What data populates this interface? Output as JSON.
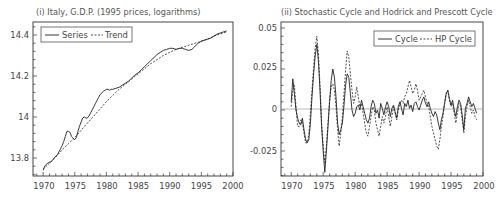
{
  "chart_data": [
    {
      "type": "line",
      "title": "(i) Italy, G.D.P. (1995 prices, logarithms)",
      "xlabel": "",
      "ylabel": "",
      "xlim": [
        1968,
        2000
      ],
      "ylim": [
        13.72,
        14.45
      ],
      "xticks": [
        1970,
        1975,
        1980,
        1985,
        1990,
        1995,
        2000
      ],
      "yticks": [
        13.8,
        14,
        14.2,
        14.4
      ],
      "ytick_labels": [
        "13.8",
        "14",
        "14.2",
        "14.4"
      ],
      "grid": false,
      "legend_position": "upper left",
      "series": [
        {
          "name": "Series",
          "style": "solid",
          "x": [
            1970.0,
            1970.25,
            1970.5,
            1970.75,
            1971.0,
            1971.25,
            1971.5,
            1971.75,
            1972.0,
            1972.25,
            1972.5,
            1972.75,
            1973.0,
            1973.25,
            1973.5,
            1973.75,
            1974.0,
            1974.25,
            1974.5,
            1974.75,
            1975.0,
            1975.25,
            1975.5,
            1975.75,
            1976.0,
            1976.25,
            1976.5,
            1976.75,
            1977.0,
            1977.25,
            1977.5,
            1977.75,
            1978.0,
            1978.25,
            1978.5,
            1978.75,
            1979.0,
            1979.5,
            1980.0,
            1980.25,
            1980.5,
            1980.75,
            1981.0,
            1981.5,
            1982.0,
            1982.5,
            1983.0,
            1983.5,
            1984.0,
            1984.5,
            1985.0,
            1985.5,
            1986.0,
            1986.5,
            1987.0,
            1987.5,
            1988.0,
            1988.5,
            1989.0,
            1989.5,
            1990.0,
            1990.5,
            1991.0,
            1991.5,
            1992.0,
            1992.5,
            1993.0,
            1993.5,
            1994.0,
            1994.5,
            1995.0,
            1995.5,
            1996.0,
            1996.5,
            1997.0,
            1997.5,
            1998.0,
            1998.5,
            1999.0
          ],
          "values": [
            13.74,
            13.76,
            13.77,
            13.775,
            13.78,
            13.78,
            13.79,
            13.8,
            13.81,
            13.815,
            13.83,
            13.845,
            13.86,
            13.88,
            13.905,
            13.93,
            13.93,
            13.925,
            13.905,
            13.895,
            13.89,
            13.9,
            13.93,
            13.955,
            13.975,
            13.995,
            14.0,
            13.995,
            13.995,
            14.005,
            14.02,
            14.035,
            14.05,
            14.065,
            14.08,
            14.095,
            14.11,
            14.125,
            14.135,
            14.135,
            14.13,
            14.135,
            14.135,
            14.14,
            14.145,
            14.155,
            14.165,
            14.175,
            14.19,
            14.205,
            14.215,
            14.23,
            14.245,
            14.26,
            14.275,
            14.29,
            14.305,
            14.315,
            14.325,
            14.33,
            14.335,
            14.335,
            14.33,
            14.335,
            14.335,
            14.33,
            14.325,
            14.33,
            14.345,
            14.36,
            14.37,
            14.375,
            14.38,
            14.385,
            14.395,
            14.405,
            14.41,
            14.415,
            14.42
          ]
        },
        {
          "name": "Trend",
          "style": "dashed",
          "x": [
            1970.0,
            1971.0,
            1972.0,
            1973.0,
            1974.0,
            1975.0,
            1976.0,
            1977.0,
            1978.0,
            1979.0,
            1980.0,
            1981.0,
            1982.0,
            1983.0,
            1984.0,
            1985.0,
            1986.0,
            1987.0,
            1988.0,
            1989.0,
            1990.0,
            1991.0,
            1992.0,
            1993.0,
            1994.0,
            1995.0,
            1996.0,
            1997.0,
            1998.0,
            1999.0
          ],
          "values": [
            13.745,
            13.775,
            13.805,
            13.84,
            13.87,
            13.9,
            13.935,
            13.97,
            14.005,
            14.04,
            14.075,
            14.105,
            14.135,
            14.16,
            14.185,
            14.21,
            14.235,
            14.26,
            14.28,
            14.3,
            14.315,
            14.33,
            14.34,
            14.35,
            14.36,
            14.37,
            14.38,
            14.395,
            14.405,
            14.415
          ]
        }
      ]
    },
    {
      "type": "line",
      "title": "(ii) Stochastic Cycle and Hodrick and Prescott Cycle",
      "xlabel": "",
      "ylabel": "",
      "xlim": [
        1968,
        2000
      ],
      "ylim": [
        -0.04,
        0.05
      ],
      "xticks": [
        1970,
        1975,
        1980,
        1985,
        1990,
        1995,
        2000
      ],
      "yticks": [
        -0.025,
        0,
        0.025,
        0.05
      ],
      "ytick_labels": [
        "-0.025",
        "0",
        "0.025",
        "0.05"
      ],
      "zero_line": true,
      "grid": false,
      "legend_position": "upper right",
      "series": [
        {
          "name": "Cycle",
          "style": "solid",
          "x": [
            1970.0,
            1970.25,
            1970.5,
            1970.75,
            1971.0,
            1971.25,
            1971.5,
            1971.75,
            1972.0,
            1972.25,
            1972.5,
            1972.75,
            1973.0,
            1973.25,
            1973.5,
            1973.75,
            1974.0,
            1974.25,
            1974.5,
            1974.75,
            1975.0,
            1975.25,
            1975.5,
            1975.75,
            1976.0,
            1976.25,
            1976.5,
            1976.75,
            1977.0,
            1977.25,
            1977.5,
            1977.75,
            1978.0,
            1978.25,
            1978.5,
            1978.75,
            1979.0,
            1979.25,
            1979.5,
            1979.75,
            1980.0,
            1980.25,
            1980.5,
            1980.75,
            1981.0,
            1981.25,
            1981.5,
            1981.75,
            1982.0,
            1982.25,
            1982.5,
            1982.75,
            1983.0,
            1983.25,
            1983.5,
            1983.75,
            1984.0,
            1984.25,
            1984.5,
            1984.75,
            1985.0,
            1985.25,
            1985.5,
            1985.75,
            1986.0,
            1986.25,
            1986.5,
            1986.75,
            1987.0,
            1987.25,
            1987.5,
            1987.75,
            1988.0,
            1988.25,
            1988.5,
            1988.75,
            1989.0,
            1989.25,
            1989.5,
            1989.75,
            1990.0,
            1990.25,
            1990.5,
            1990.75,
            1991.0,
            1991.25,
            1991.5,
            1991.75,
            1992.0,
            1992.25,
            1992.5,
            1992.75,
            1993.0,
            1993.25,
            1993.5,
            1993.75,
            1994.0,
            1994.25,
            1994.5,
            1994.75,
            1995.0,
            1995.25,
            1995.5,
            1995.75,
            1996.0,
            1996.25,
            1996.5,
            1996.75,
            1997.0,
            1997.25,
            1997.5,
            1997.75,
            1998.0,
            1998.25,
            1998.5,
            1998.75,
            1999.0
          ],
          "values": [
            0.005,
            0.019,
            0.01,
            0.0,
            -0.005,
            -0.008,
            -0.009,
            -0.005,
            -0.012,
            -0.018,
            -0.02,
            -0.018,
            -0.008,
            0.008,
            0.022,
            0.033,
            0.04,
            0.03,
            0.012,
            -0.01,
            -0.025,
            -0.038,
            -0.025,
            -0.01,
            0.005,
            0.018,
            0.025,
            0.02,
            0.008,
            -0.008,
            -0.015,
            -0.012,
            -0.008,
            0.003,
            0.015,
            0.022,
            0.02,
            0.01,
            0.0,
            -0.004,
            -0.002,
            0.002,
            0.003,
            0.0,
            0.006,
            0.002,
            -0.002,
            -0.006,
            -0.008,
            -0.005,
            0.002,
            0.006,
            0.004,
            -0.002,
            0.0,
            -0.005,
            0.004,
            0.001,
            -0.003,
            0.002,
            0.005,
            0.002,
            -0.004,
            0.001,
            0.003,
            -0.001,
            -0.005,
            0.002,
            0.005,
            0.001,
            -0.003,
            0.004,
            0.002,
            0.006,
            0.001,
            0.003,
            -0.001,
            0.004,
            0.005,
            0.002,
            0.0,
            0.003,
            0.006,
            0.008,
            0.004,
            0.002,
            0.005,
            0.001,
            -0.002,
            -0.004,
            -0.001,
            -0.003,
            -0.008,
            -0.012,
            -0.006,
            -0.002,
            0.004,
            0.01,
            0.012,
            0.007,
            0.003,
            0.006,
            0.0,
            -0.004,
            0.002,
            0.006,
            0.004,
            -0.003,
            -0.012,
            0.001,
            0.004,
            0.008,
            0.005,
            0.002,
            0.004,
            0.001,
            -0.002
          ]
        },
        {
          "name": "HP Cycle",
          "style": "dashed",
          "x": [
            1970.0,
            1970.25,
            1970.5,
            1970.75,
            1971.0,
            1971.25,
            1971.5,
            1971.75,
            1972.0,
            1972.25,
            1972.5,
            1972.75,
            1973.0,
            1973.25,
            1973.5,
            1973.75,
            1974.0,
            1974.25,
            1974.5,
            1974.75,
            1975.0,
            1975.25,
            1975.5,
            1975.75,
            1976.0,
            1976.25,
            1976.5,
            1976.75,
            1977.0,
            1977.25,
            1977.5,
            1977.75,
            1978.0,
            1978.25,
            1978.5,
            1978.75,
            1979.0,
            1979.25,
            1979.5,
            1979.75,
            1980.0,
            1980.25,
            1980.5,
            1980.75,
            1981.0,
            1981.25,
            1981.5,
            1981.75,
            1982.0,
            1982.25,
            1982.5,
            1982.75,
            1983.0,
            1983.25,
            1983.5,
            1983.75,
            1984.0,
            1984.25,
            1984.5,
            1984.75,
            1985.0,
            1985.25,
            1985.5,
            1985.75,
            1986.0,
            1986.25,
            1986.5,
            1986.75,
            1987.0,
            1987.25,
            1987.5,
            1987.75,
            1988.0,
            1988.25,
            1988.5,
            1988.75,
            1989.0,
            1989.25,
            1989.5,
            1989.75,
            1990.0,
            1990.25,
            1990.5,
            1990.75,
            1991.0,
            1991.25,
            1991.5,
            1991.75,
            1992.0,
            1992.25,
            1992.5,
            1992.75,
            1993.0,
            1993.25,
            1993.5,
            1993.75,
            1994.0,
            1994.25,
            1994.5,
            1994.75,
            1995.0,
            1995.25,
            1995.5,
            1995.75,
            1996.0,
            1996.25,
            1996.5,
            1996.75,
            1997.0,
            1997.25,
            1997.5,
            1997.75,
            1998.0,
            1998.25,
            1998.5,
            1998.75,
            1999.0
          ],
          "values": [
            0.002,
            0.012,
            0.015,
            0.002,
            -0.01,
            -0.01,
            -0.006,
            -0.008,
            -0.014,
            -0.02,
            -0.02,
            -0.015,
            -0.002,
            0.012,
            0.026,
            0.038,
            0.045,
            0.035,
            0.015,
            -0.008,
            -0.022,
            -0.032,
            -0.022,
            -0.008,
            0.006,
            0.014,
            0.016,
            0.012,
            0.002,
            -0.012,
            -0.022,
            -0.014,
            -0.004,
            0.01,
            0.024,
            0.036,
            0.032,
            0.022,
            0.012,
            0.004,
            0.008,
            0.014,
            0.008,
            0.002,
            0.004,
            -0.002,
            -0.008,
            -0.014,
            -0.016,
            -0.01,
            -0.004,
            0.002,
            0.0,
            -0.008,
            -0.012,
            -0.016,
            -0.01,
            -0.004,
            -0.008,
            -0.004,
            0.002,
            -0.004,
            -0.01,
            -0.004,
            0.002,
            -0.002,
            -0.006,
            0.0,
            0.004,
            0.006,
            0.004,
            0.008,
            0.01,
            0.014,
            0.018,
            0.014,
            0.01,
            0.012,
            0.016,
            0.012,
            0.006,
            0.008,
            0.01,
            0.012,
            0.008,
            0.004,
            0.002,
            -0.004,
            -0.01,
            -0.014,
            -0.018,
            -0.022,
            -0.024,
            -0.018,
            -0.01,
            -0.004,
            0.004,
            0.01,
            0.012,
            0.006,
            0.002,
            0.004,
            -0.002,
            -0.008,
            -0.002,
            0.004,
            0.002,
            -0.006,
            -0.014,
            -0.004,
            0.002,
            0.006,
            0.002,
            -0.002,
            0.0,
            -0.004,
            -0.006
          ]
        }
      ]
    }
  ],
  "charts": [
    {
      "title": "(i) Italy, G.D.P. (1995 prices, logarithms)",
      "legend": {
        "series_label": "Series",
        "trend_label": "Trend"
      },
      "xtick_labels": [
        "1970",
        "1975",
        "1980",
        "1985",
        "1990",
        "1995",
        "2000"
      ],
      "ytick_labels": [
        "14.4",
        "14.2",
        "14",
        "13.8"
      ]
    },
    {
      "title": "(ii) Stochastic Cycle and Hodrick and Prescott Cycle",
      "legend": {
        "cycle_label": "Cycle",
        "hp_label": "HP Cycle"
      },
      "xtick_labels": [
        "1970",
        "1975",
        "1980",
        "1985",
        "1990",
        "1995",
        "2000"
      ],
      "ytick_labels": [
        "0.05",
        "0.025",
        "0",
        "-0.025"
      ]
    }
  ],
  "colors": {
    "line": "#222222",
    "axis": "#333333",
    "zero_line": "#999999",
    "text": "#444444"
  }
}
